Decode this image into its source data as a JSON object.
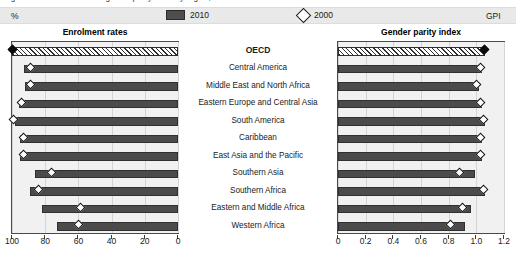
{
  "caption": {
    "text": "Figure: Enrolment rates and gender parity index by region, 2000 and 2010"
  },
  "legend": {
    "position": "top-center",
    "items": [
      {
        "label": "2010",
        "marker": "bar-swatch",
        "color": "#4e4e4e"
      },
      {
        "label": "2000",
        "marker": "diamond-outline",
        "color": "#ffffff"
      }
    ]
  },
  "left_chart": {
    "title": "Enrolment rates",
    "unit": "%"
  },
  "right_chart": {
    "title": "Gender parity index",
    "unit": "GPI"
  },
  "categories": [
    "OECD",
    "Central America",
    "Middle East and North Africa",
    "Eastern Europe and Central Asia",
    "South America",
    "Caribbean",
    "East Asia and the Pacific",
    "Southern Asia",
    "Southern Africa",
    "Eastern and Middle Africa",
    "Western Africa"
  ],
  "chart_data": [
    {
      "type": "bar",
      "title": "Enrolment rates",
      "xlabel": "%",
      "ylabel": "",
      "xlim": [
        100,
        0
      ],
      "reversed_axis": true,
      "xticks": [
        100,
        80,
        60,
        40,
        20,
        0
      ],
      "xtick_labels": [
        "100",
        "80",
        "60",
        "40",
        "20",
        "0"
      ],
      "grid": true,
      "legend_position": "top",
      "categories": [
        "OECD",
        "Central America",
        "Middle East and North Africa",
        "Eastern Europe and Central Asia",
        "South America",
        "Caribbean",
        "East Asia and the Pacific",
        "Southern Asia",
        "Southern Africa",
        "Eastern and Middle Africa",
        "Western Africa"
      ],
      "series": [
        {
          "name": "2010",
          "marker": "bar",
          "values": [
            100,
            93,
            92,
            96,
            98,
            95,
            95,
            86,
            89,
            82,
            73
          ]
        },
        {
          "name": "2000",
          "marker": "diamond",
          "values": [
            100,
            89,
            89,
            94,
            99,
            93,
            93,
            76,
            84,
            59,
            60
          ]
        }
      ],
      "highlight_row": "OECD",
      "highlight_style": "hatched"
    },
    {
      "type": "bar",
      "title": "Gender parity index",
      "xlabel": "GPI",
      "ylabel": "",
      "xlim": [
        0,
        1.2
      ],
      "reversed_axis": false,
      "xticks": [
        0,
        0.2,
        0.4,
        0.6,
        0.8,
        1.0,
        1.2
      ],
      "xtick_labels": [
        "0",
        "0.2",
        "0.4",
        "0.6",
        "0.8",
        "1.0",
        "1.2"
      ],
      "grid": true,
      "legend_position": "top",
      "categories": [
        "OECD",
        "Central America",
        "Middle East and North Africa",
        "Eastern Europe and Central Asia",
        "South America",
        "Caribbean",
        "East Asia and the Pacific",
        "Southern Asia",
        "Southern Africa",
        "Eastern and Middle Africa",
        "Western Africa"
      ],
      "series": [
        {
          "name": "2010",
          "marker": "bar",
          "values": [
            1.06,
            1.04,
            1.02,
            1.04,
            1.06,
            1.04,
            1.04,
            0.99,
            1.06,
            0.96,
            0.92
          ]
        },
        {
          "name": "2000",
          "marker": "diamond",
          "values": [
            1.06,
            1.03,
            1.0,
            1.03,
            1.05,
            1.03,
            1.03,
            0.88,
            1.05,
            0.9,
            0.81
          ]
        }
      ],
      "highlight_row": "OECD",
      "highlight_style": "hatched"
    }
  ]
}
